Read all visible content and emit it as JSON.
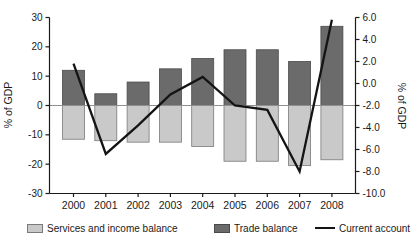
{
  "chart": {
    "left_axis": {
      "label": "% of GDP"
    },
    "right_axis": {
      "label": "% of GDP"
    }
  },
  "chart_data": {
    "type": "bar+line combo, dual y-axis",
    "categories": [
      "2000",
      "2001",
      "2002",
      "2003",
      "2004",
      "2005",
      "2006",
      "2007",
      "2008"
    ],
    "series": [
      {
        "name": "Services and income balance",
        "type": "bar",
        "axis": "left",
        "color": "#c9c9c9",
        "stroke": "#7a7a7a",
        "values": [
          -11.5,
          -12,
          -12.5,
          -12.5,
          -14,
          -19,
          -19,
          -20.5,
          -18.5
        ]
      },
      {
        "name": "Trade balance",
        "type": "bar",
        "axis": "left",
        "color": "#6b6b6b",
        "stroke": "#4a4a4a",
        "values": [
          12,
          4,
          8,
          12.5,
          16,
          19,
          19,
          15,
          27
        ]
      },
      {
        "name": "Current account",
        "type": "line",
        "axis": "right",
        "color": "#141414",
        "values": [
          1.8,
          -6.4,
          -3.8,
          -1.0,
          0.6,
          -2.0,
          -2.4,
          -8.0,
          5.8
        ]
      }
    ],
    "left_axis": {
      "ylim": [
        -30,
        30
      ],
      "tick_values": [
        30,
        20,
        10,
        0,
        -10,
        -20,
        -30
      ],
      "tick_labels": [
        "30",
        "20",
        "10",
        "0",
        "-10",
        "-20",
        "-30"
      ]
    },
    "right_axis": {
      "ylim": [
        -10,
        6
      ],
      "tick_values": [
        6,
        4,
        2,
        0,
        -2,
        -4,
        -6,
        -8,
        -10
      ],
      "tick_labels": [
        "6.0",
        "4.0",
        "2.0",
        "0.0",
        "-2.0",
        "-4.0",
        "-6.0",
        "-8.0",
        "-10.0"
      ]
    },
    "zero_line": {
      "left_value": 0,
      "right_value": -2.0
    },
    "grid": false,
    "legend_position": "bottom"
  }
}
